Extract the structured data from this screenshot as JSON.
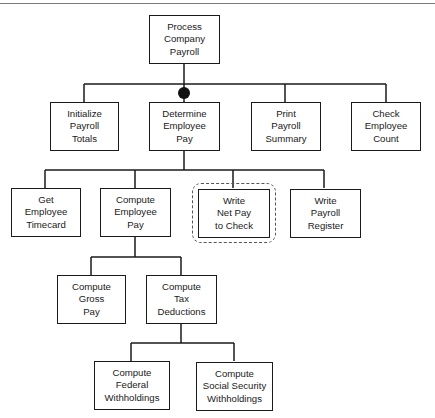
{
  "diagram": {
    "type": "structure-chart",
    "root": {
      "id": "process-company-payroll",
      "lines": [
        "Process",
        "Company",
        "Payroll"
      ]
    },
    "level1": [
      {
        "id": "initialize-payroll-totals",
        "lines": [
          "Initialize",
          "Payroll",
          "Totals"
        ]
      },
      {
        "id": "determine-employee-pay",
        "lines": [
          "Determine",
          "Employee",
          "Pay"
        ],
        "marker": "iteration-dot"
      },
      {
        "id": "print-payroll-summary",
        "lines": [
          "Print",
          "Payroll",
          "Summary"
        ]
      },
      {
        "id": "check-employee-count",
        "lines": [
          "Check",
          "Employee",
          "Count"
        ]
      }
    ],
    "level2": [
      {
        "id": "get-employee-timecard",
        "lines": [
          "Get",
          "Employee",
          "Timecard"
        ]
      },
      {
        "id": "compute-employee-pay",
        "lines": [
          "Compute",
          "Employee",
          "Pay"
        ]
      },
      {
        "id": "write-net-pay-to-check",
        "lines": [
          "Write",
          "Net Pay",
          "to Check"
        ],
        "highlight": "dashed"
      },
      {
        "id": "write-payroll-register",
        "lines": [
          "Write",
          "Payroll",
          "Register"
        ]
      }
    ],
    "level3": [
      {
        "id": "compute-gross-pay",
        "lines": [
          "Compute",
          "Gross",
          "Pay"
        ]
      },
      {
        "id": "compute-tax-deductions",
        "lines": [
          "Compute",
          "Tax",
          "Deductions"
        ]
      }
    ],
    "level4": [
      {
        "id": "compute-federal-withholdings",
        "lines": [
          "Compute",
          "Federal",
          "Withholdings"
        ]
      },
      {
        "id": "compute-social-security-withholdings",
        "lines": [
          "Compute",
          "Social Security",
          "Withholdings"
        ]
      }
    ],
    "colors": {
      "line": "#1a1a1a",
      "dashed": "#555555",
      "rule": "#7a7a7a"
    }
  }
}
